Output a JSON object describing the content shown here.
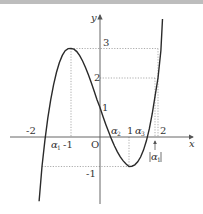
{
  "figure": {
    "function": "y = x^3 - 3x + 1",
    "axis_labels": {
      "x": "x",
      "y": "y",
      "origin": "O"
    },
    "x_ticks": [
      "-2",
      "-1",
      "1",
      "2"
    ],
    "y_ticks": [
      "3",
      "2",
      "1",
      "-1"
    ],
    "roots": [
      {
        "name": "α",
        "sub": "1"
      },
      {
        "name": "α",
        "sub": "2"
      },
      {
        "name": "α",
        "sub": "3"
      }
    ],
    "abs_annotation": {
      "name": "α",
      "sub": "1",
      "text": "|α1|"
    },
    "colors": {
      "curve": "#2a2a2a",
      "axis": "#555555",
      "guide": "#888888"
    }
  }
}
